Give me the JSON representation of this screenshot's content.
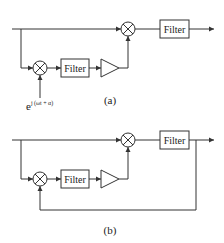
{
  "diagrams": [
    {
      "id": "a",
      "caption": "(a)",
      "blocks": {
        "output_filter": "Filter",
        "inner_filter": "Filter"
      },
      "reference_signal": {
        "base": "e",
        "exponent": "j (ωt + α)"
      },
      "components": [
        "input line",
        "multiplier (top)",
        "output filter",
        "multiplier (bottom)",
        "inner filter",
        "amplifier"
      ],
      "feedback": false
    },
    {
      "id": "b",
      "caption": "(b)",
      "blocks": {
        "output_filter": "Filter",
        "inner_filter": "Filter"
      },
      "components": [
        "input line",
        "multiplier (top)",
        "output filter",
        "multiplier (bottom)",
        "inner filter",
        "amplifier",
        "feedback loop from output"
      ],
      "feedback": true
    }
  ],
  "colors": {
    "line": "#333333",
    "background": "#ffffff"
  }
}
